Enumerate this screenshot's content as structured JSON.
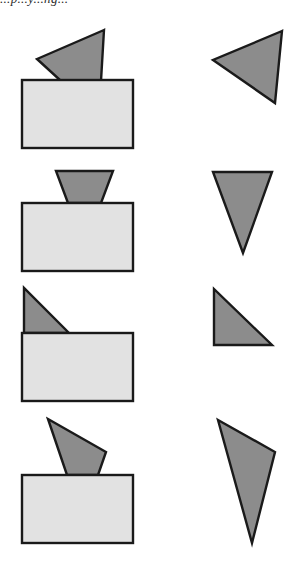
{
  "figure": {
    "caption_fragment": "...p...y...ng...",
    "canvas": {
      "width": 296,
      "height": 568
    },
    "colors": {
      "background": "#ffffff",
      "occluder_fill": "#e2e2e2",
      "triangle_fill": "#8c8c8c",
      "outline": "#1a1a1a"
    },
    "stroke_width": 2.4,
    "rows": [
      {
        "id": "row-1",
        "name": "wide-tilted-triangle",
        "occluded": {
          "shape_name": "partially-occluded-triangle",
          "triangle_points": "104,30 37,59 92,120",
          "visible_points": "104,30 37,59 61,81 101,81",
          "occluder_name": "rectangle-occluder",
          "occluder": {
            "x": 22,
            "y": 80,
            "width": 111,
            "height": 68
          }
        },
        "isolated": {
          "shape_name": "isolated-triangle",
          "points": "282,31 213,60 275,103"
        }
      },
      {
        "id": "row-2",
        "name": "narrow-downward-triangle",
        "occluded": {
          "shape_name": "partially-occluded-triangle",
          "triangle_points": "56,171 113,171 83,253",
          "visible_points": "56,171 113,171 101,203 68,203",
          "occluder_name": "rectangle-occluder",
          "occluder": {
            "x": 22,
            "y": 203,
            "width": 111,
            "height": 68
          }
        },
        "isolated": {
          "shape_name": "isolated-triangle",
          "points": "213,172 272,172 243,253"
        }
      },
      {
        "id": "row-3",
        "name": "right-angle-triangle",
        "occluded": {
          "shape_name": "partially-occluded-triangle",
          "triangle_points": "24,288 24,333 69,333",
          "visible_points": "24,288 24,333 69,333",
          "occluder_name": "rectangle-occluder",
          "occluder": {
            "x": 22,
            "y": 333,
            "width": 111,
            "height": 68
          }
        },
        "isolated": {
          "shape_name": "isolated-triangle",
          "points": "214,289 214,345 272,345"
        }
      },
      {
        "id": "row-4",
        "name": "tall-slanted-triangle",
        "occluded": {
          "shape_name": "partially-occluded-triangle",
          "triangle_points": "48,419 106,452 78,535",
          "visible_points": "48,419 106,452 98,475 67,475",
          "occluder_name": "rectangle-occluder",
          "occluder": {
            "x": 22,
            "y": 475,
            "width": 111,
            "height": 68
          }
        },
        "isolated": {
          "shape_name": "isolated-triangle",
          "points": "218,420 275,452 252,543"
        }
      }
    ]
  }
}
